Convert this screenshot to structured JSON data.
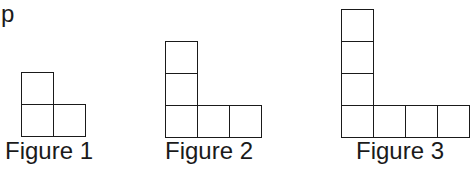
{
  "corner_text": "p",
  "cell_size": 32,
  "figures": [
    {
      "label": "Figure 1",
      "origin": [
        21,
        72
      ],
      "cells": [
        [
          0,
          0
        ],
        [
          0,
          1
        ],
        [
          1,
          1
        ]
      ],
      "label_pos": [
        5,
        137
      ]
    },
    {
      "label": "Figure 2",
      "origin": [
        165,
        41
      ],
      "cells": [
        [
          0,
          0
        ],
        [
          0,
          1
        ],
        [
          0,
          2
        ],
        [
          1,
          2
        ],
        [
          2,
          2
        ]
      ],
      "label_pos": [
        165,
        137
      ]
    },
    {
      "label": "Figure 3",
      "origin": [
        341,
        9
      ],
      "cells": [
        [
          0,
          0
        ],
        [
          0,
          1
        ],
        [
          0,
          2
        ],
        [
          0,
          3
        ],
        [
          1,
          3
        ],
        [
          2,
          3
        ],
        [
          3,
          3
        ]
      ],
      "label_pos": [
        356,
        137
      ]
    }
  ]
}
